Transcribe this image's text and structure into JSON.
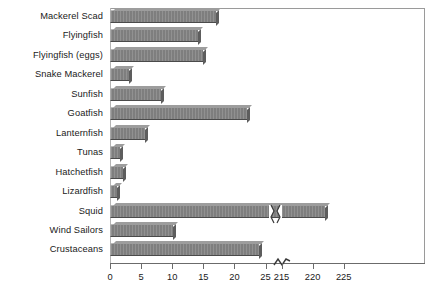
{
  "chart_data": {
    "type": "bar",
    "orientation": "horizontal",
    "title": "",
    "xlabel": "",
    "ylabel": "",
    "grid": false,
    "legend": null,
    "axis_break": {
      "present": true,
      "between": [
        25,
        215
      ],
      "symbol": "~"
    },
    "xticks": [
      0,
      5,
      10,
      15,
      20,
      25,
      215,
      220,
      225
    ],
    "xtick_labels": [
      "0",
      "5",
      "10",
      "15",
      "20",
      "25",
      "215",
      "220",
      "225"
    ],
    "xlim_lower_segment": [
      0,
      25
    ],
    "xlim_upper_segment": [
      215,
      227
    ],
    "categories": [
      "Mackerel Scad",
      "Flyingfish",
      "Flyingfish (eggs)",
      "Snake Mackerel",
      "Sunfish",
      "Goatfish",
      "Lanternfish",
      "Tunas",
      "Hatchetfish",
      "Lizardfish",
      "Squid",
      "Wind Sailors",
      "Crustaceans"
    ],
    "values": [
      17,
      14.2,
      15,
      3,
      8.2,
      22,
      5.6,
      1.6,
      2.1,
      1.1,
      222,
      10.2,
      24
    ],
    "bars_with_break": [
      "Squid"
    ],
    "bar_color": "#858585",
    "bar_edge_color": "#4a4a4a"
  }
}
